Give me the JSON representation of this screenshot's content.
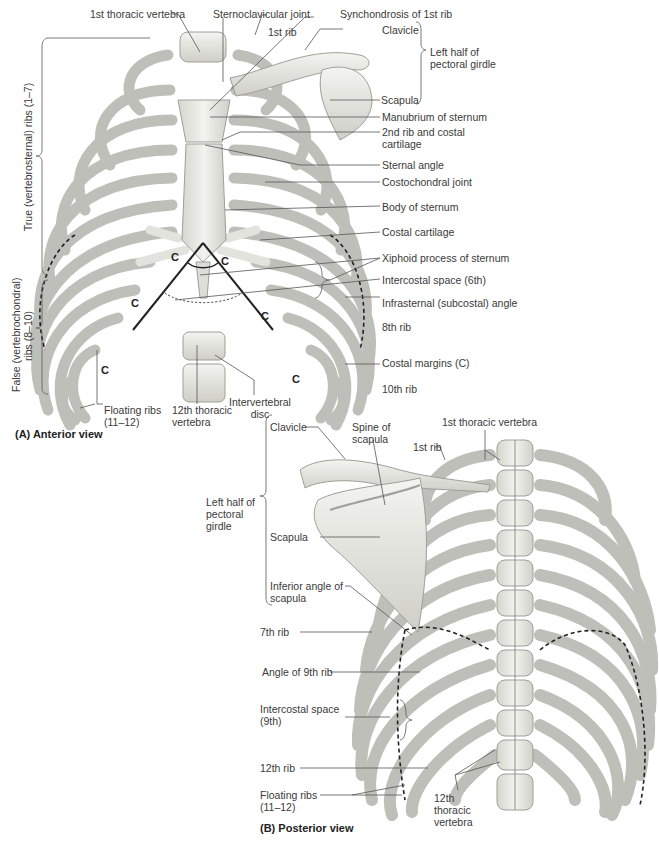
{
  "figure_a": {
    "caption": "(A) Anterior view",
    "labels": {
      "first_thoracic_vertebra": "1st thoracic vertebra",
      "sternoclavicular_joint": "Sternoclavicular joint",
      "synchondrosis_first_rib": "Synchondrosis of 1st rib",
      "first_rib": "1st rib",
      "clavicle": "Clavicle",
      "left_half_pectoral_girdle": "Left half of pectoral girdle",
      "scapula": "Scapula",
      "manubrium": "Manubrium of sternum",
      "second_rib_costal_cartilage": "2nd rib and costal cartilage",
      "sternal_angle": "Sternal angle",
      "costochondral_joint": "Costochondral joint",
      "body_of_sternum": "Body of sternum",
      "costal_cartilage": "Costal cartilage",
      "xiphoid_process": "Xiphoid process of sternum",
      "intercostal_space_6th": "Intercostal space (6th)",
      "infrasternal_angle": "Infrasternal (subcostal) angle",
      "eighth_rib": "8th rib",
      "costal_margins": "Costal margins (C)",
      "tenth_rib": "10th rib",
      "intervertebral_disc": "Intervertebral disc",
      "twelfth_thoracic_vertebra": "12th thoracic vertebra",
      "floating_ribs": "Floating ribs (11–12)",
      "true_ribs": "True (vertebrosternal) ribs (1–7)",
      "false_ribs_line1": "False (vertebrochondral)",
      "false_ribs_line2": "ribs (8–10)"
    },
    "costal_margin_marker": "C"
  },
  "figure_b": {
    "caption": "(B) Posterior view",
    "labels": {
      "clavicle": "Clavicle",
      "spine_of_scapula": "Spine of scapula",
      "first_rib": "1st rib",
      "first_thoracic_vertebra": "1st thoracic vertebra",
      "left_half_pectoral_girdle": "Left half of pectoral girdle",
      "scapula": "Scapula",
      "inferior_angle_scapula": "Inferior angle of scapula",
      "seventh_rib": "7th rib",
      "angle_ninth_rib": "Angle of 9th rib",
      "intercostal_space_9th": "Intercostal space (9th)",
      "twelfth_rib": "12th rib",
      "floating_ribs": "Floating ribs (11–12)",
      "twelfth_thoracic_vertebra": "12th thoracic vertebra"
    }
  },
  "colors": {
    "bone": "#ebebe6",
    "bone_shade": "#c9c9c2",
    "outline": "#9a9a94",
    "leader": "#555555",
    "text": "#3a3a3a"
  }
}
